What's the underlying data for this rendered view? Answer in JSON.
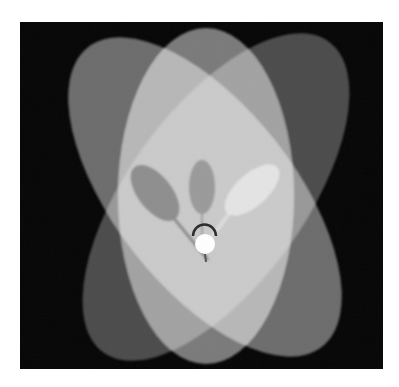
{
  "image": {
    "description": "Photograph of three overlapping elliptical light projections on a dark backdrop, with a bulb and spoon-shaped shadows at the center",
    "background_color": "#ffffff",
    "frame_color": "#050505"
  },
  "ellipses": [
    {
      "name": "tilted-left-ellipse",
      "color": "#6c6c6c"
    },
    {
      "name": "tilted-right-ellipse",
      "color": "#4a4a4a"
    },
    {
      "name": "vertical-ellipse",
      "color": "#7a7a7a"
    }
  ],
  "shadows": [
    {
      "name": "left-spoon-shadow",
      "color": "#8e8e8e"
    },
    {
      "name": "center-oval-shadow",
      "color": "#9a9a9a"
    },
    {
      "name": "right-spoon-highlight",
      "color": "#efefef"
    }
  ],
  "bulb": {
    "color": "#ffffff"
  }
}
